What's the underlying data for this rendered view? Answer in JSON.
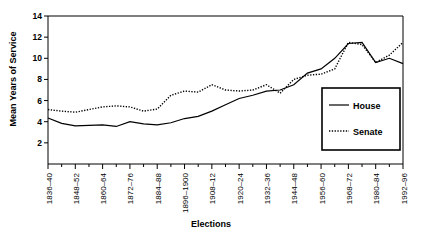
{
  "chart_data": {
    "type": "line",
    "title": "",
    "xlabel": "Elections",
    "ylabel": "Mean Years of Service",
    "ylim": [
      0,
      14
    ],
    "yticks": [
      2,
      4,
      6,
      8,
      10,
      12,
      14
    ],
    "grid": false,
    "legend_position": "right",
    "xtick_labels": [
      "1836–40",
      "1848–52",
      "1860–64",
      "1872–76",
      "1884–88",
      "1896–1900",
      "1908–12",
      "1920–24",
      "1932–36",
      "1944–48",
      "1956–60",
      "1968–72",
      "1980–84",
      "1992–96"
    ],
    "x": [
      "1836-40",
      "1842-46",
      "1848-52",
      "1854-58",
      "1860-64",
      "1866-70",
      "1872-76",
      "1878-82",
      "1884-88",
      "1890-94",
      "1896-1900",
      "1902-06",
      "1908-12",
      "1914-18",
      "1920-24",
      "1926-30",
      "1932-36",
      "1938-42",
      "1944-48",
      "1950-54",
      "1956-60",
      "1962-66",
      "1968-72",
      "1974-78",
      "1980-84",
      "1986-90",
      "1992-96"
    ],
    "series": [
      {
        "name": "House",
        "style": "solid",
        "color": "#000000",
        "values": [
          4.35,
          3.85,
          3.6,
          3.65,
          3.7,
          3.55,
          4.0,
          3.8,
          3.7,
          3.9,
          4.3,
          4.5,
          5.0,
          5.6,
          6.2,
          6.5,
          6.9,
          7.0,
          7.5,
          8.6,
          9.0,
          10.0,
          11.4,
          11.5,
          9.6,
          10.0,
          9.5
        ]
      },
      {
        "name": "Senate",
        "style": "dotted",
        "color": "#000000",
        "values": [
          5.15,
          5.0,
          4.9,
          5.15,
          5.4,
          5.5,
          5.4,
          5.0,
          5.2,
          6.5,
          6.9,
          6.8,
          7.5,
          7.0,
          6.9,
          7.0,
          7.5,
          6.7,
          8.0,
          8.4,
          8.5,
          9.0,
          11.5,
          11.3,
          9.6,
          10.3,
          11.5
        ]
      }
    ],
    "legend": [
      {
        "label": "House",
        "style": "solid"
      },
      {
        "label": "Senate",
        "style": "dotted"
      }
    ]
  }
}
